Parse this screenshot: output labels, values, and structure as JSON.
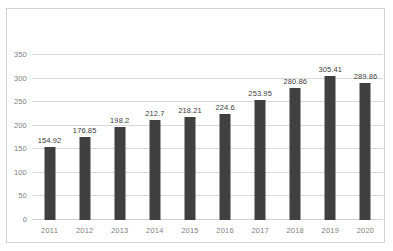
{
  "chart_data": {
    "type": "bar",
    "title": "",
    "subtitle": "",
    "xlabel": "",
    "ylabel": "",
    "categories": [
      "2011",
      "2012",
      "2013",
      "2014",
      "2015",
      "2016",
      "2017",
      "2018",
      "2019",
      "2020"
    ],
    "values": [
      154.92,
      176.85,
      198.2,
      212.7,
      218.21,
      224.6,
      253.95,
      280.86,
      305.41,
      289.86
    ],
    "data_labels": [
      "154.92",
      "176.85",
      "198.2",
      "212.7",
      "218.21",
      "224.6",
      "253.95",
      "280.86",
      "305.41",
      "289.86"
    ],
    "ylim": [
      0,
      350
    ],
    "ytick_step": 50,
    "ytick_labels": [
      "0",
      "50",
      "100",
      "150",
      "200",
      "250",
      "300",
      "350"
    ],
    "ytick_values": [
      0,
      50,
      100,
      150,
      200,
      250,
      300,
      350
    ],
    "grid": true,
    "grid_axis": "y",
    "legend": false,
    "legend_position": "none",
    "series": [
      {
        "name": "",
        "values": [
          154.92,
          176.85,
          198.2,
          212.7,
          218.21,
          224.6,
          253.95,
          280.86,
          305.41,
          289.86
        ]
      }
    ],
    "colors": {
      "bar": "#404040",
      "gridline": "#d9d9d9",
      "axis_text": "#808080",
      "label_text": "#404040",
      "plot_background": "#ffffff",
      "border": "#d4d4d4"
    }
  }
}
